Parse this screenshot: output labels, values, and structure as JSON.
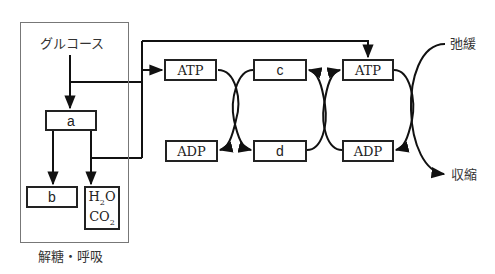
{
  "diagram": {
    "type": "metabolic-flow",
    "outer_group_label": "解糖・呼吸",
    "source": "グルコース",
    "nodes": {
      "a": "a",
      "b": "b",
      "h2o": "H",
      "h2o_sub": "2",
      "h2o_tail": "O",
      "co2": "CO",
      "co2_sub": "2",
      "atp1": "ATP",
      "adp1": "ADP",
      "c": "c",
      "d": "d",
      "atp2": "ATP",
      "adp2": "ADP"
    },
    "outcomes": {
      "relax": "弛緩",
      "contract": "収縮"
    },
    "edges": [
      {
        "from": "グルコース",
        "to": "a"
      },
      {
        "from": "グルコース",
        "to": "ATP (1)"
      },
      {
        "from": "グルコース",
        "to": "ATP (2)"
      },
      {
        "from": "a",
        "to": "b"
      },
      {
        "from": "a",
        "to": "H2O/CO2"
      },
      {
        "from": "a",
        "to": "ATP (1)"
      },
      {
        "from": "ATP (1)",
        "to": "ADP (1)"
      },
      {
        "from": "c",
        "to": "d"
      },
      {
        "from": "d",
        "to": "c"
      },
      {
        "from": "ADP (2)",
        "to": "ATP (2)"
      },
      {
        "from": "ATP (2)",
        "to": "ADP (2)"
      },
      {
        "from": "弛緩",
        "to": "収縮"
      }
    ]
  }
}
